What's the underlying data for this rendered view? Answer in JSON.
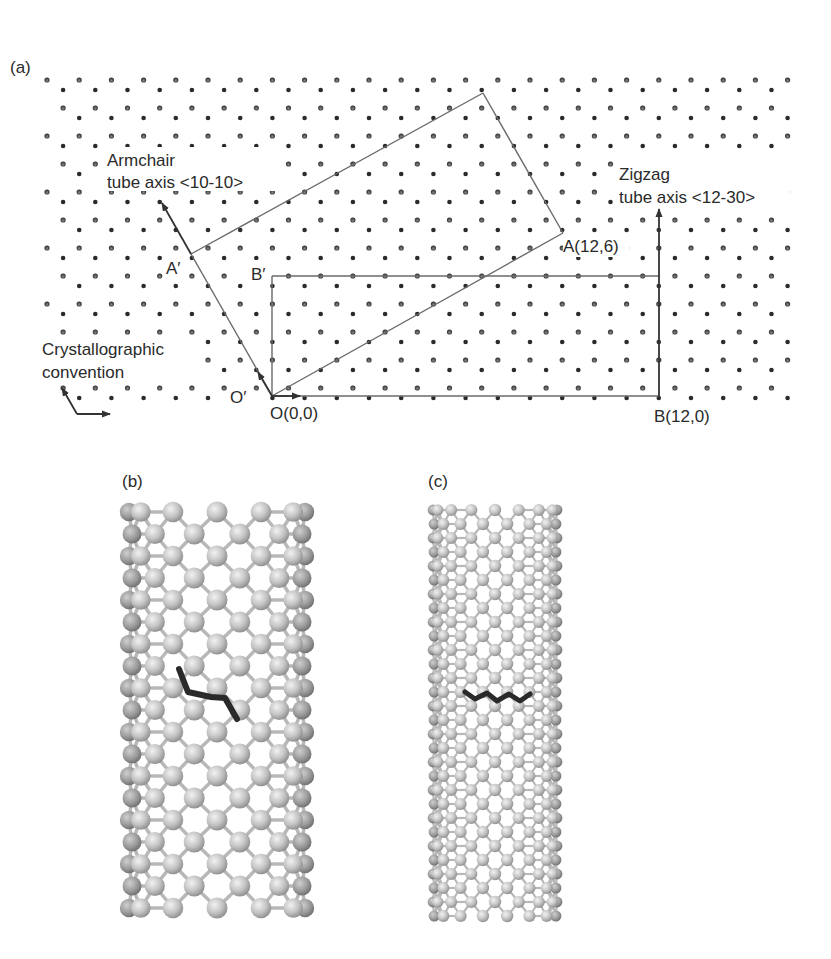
{
  "figure": {
    "panels": [
      {
        "id": "a",
        "label": "(a)",
        "description": "Graphene lattice with chiral/translation vectors",
        "annotations": {
          "armchair_line1": "Armchair",
          "armchair_line2": "tube axis <10-10>",
          "zigzag_line1": "Zigzag",
          "zigzag_line2": "tube axis <12-30>",
          "crystallographic_line1": "Crystallographic",
          "crystallographic_line2": "convention",
          "point_A": "A(12,6)",
          "point_A_prime": "A′",
          "point_B": "B(12,0)",
          "point_B_prime": "B′",
          "point_O": "O(0,0)",
          "point_O_prime": "O′"
        }
      },
      {
        "id": "b",
        "label": "(b)",
        "description": "Chiral (12,6) nanotube with highlighted chain"
      },
      {
        "id": "c",
        "label": "(c)",
        "description": "Zigzag (12,0) nanotube with highlighted chain"
      }
    ],
    "colors": {
      "atom_dark": "#2b2b2b",
      "line": "#6a6a6a",
      "arrow": "#333333",
      "tube_atom_light": "#d4d4d4",
      "tube_atom_mid": "#a8a8a8",
      "tube_atom_dark": "#888888",
      "highlight_chain": "#2a2a2a"
    }
  }
}
